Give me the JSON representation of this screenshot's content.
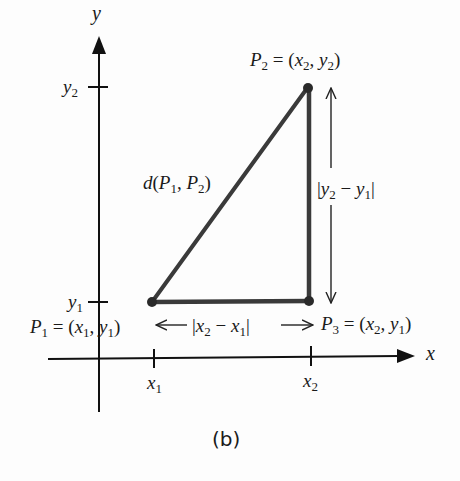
{
  "figure": {
    "caption": "(b)",
    "axes": {
      "x_label": "x",
      "y_label": "y",
      "x_ticks": [
        "x1",
        "x2"
      ],
      "y_ticks": [
        "y1",
        "y2"
      ]
    },
    "points": [
      {
        "name": "P1",
        "label": "P₁ = (x₁, y₁)"
      },
      {
        "name": "P2",
        "label": "P₂ = (x₂, y₂)"
      },
      {
        "name": "P3",
        "label": "P₃ = (x₂, y₁)"
      }
    ],
    "annotations": {
      "hypotenuse": "d(P₁, P₂)",
      "horizontal_leg": "|x₂ − x₁|",
      "vertical_leg": "|y₂ − y₁|"
    },
    "colors": {
      "axis": "#111111",
      "triangle": "#3a3a3a",
      "text": "#1a1a1a"
    }
  }
}
